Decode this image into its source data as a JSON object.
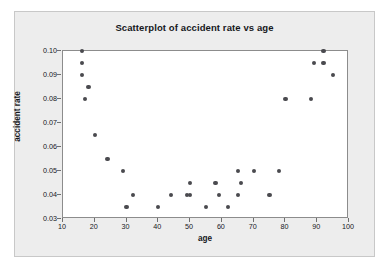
{
  "chart_data": {
    "type": "scatter",
    "title": "Scatterplot of accident rate vs age",
    "xlabel": "age",
    "ylabel": "accident rate",
    "xlim": [
      10,
      100
    ],
    "ylim": [
      0.03,
      0.1
    ],
    "grid": false,
    "legend": null,
    "marker_color": "#4a4a4f",
    "xticks": [
      10,
      20,
      30,
      40,
      50,
      60,
      70,
      80,
      90,
      100
    ],
    "xtick_labels": [
      "10",
      "20",
      "30",
      "40",
      "50",
      "60",
      "70",
      "80",
      "90",
      "100"
    ],
    "yticks": [
      0.03,
      0.04,
      0.05,
      0.06,
      0.07,
      0.08,
      0.09,
      0.1
    ],
    "ytick_labels": [
      "0.03",
      "0.04",
      "0.05",
      "0.06",
      "0.07",
      "0.08",
      "0.09",
      "0.10"
    ],
    "series": [
      {
        "name": "accident rate",
        "points": [
          {
            "x": 16,
            "y": 0.1
          },
          {
            "x": 16,
            "y": 0.095
          },
          {
            "x": 16,
            "y": 0.09
          },
          {
            "x": 18,
            "y": 0.085
          },
          {
            "x": 17,
            "y": 0.08
          },
          {
            "x": 20,
            "y": 0.065
          },
          {
            "x": 24,
            "y": 0.055
          },
          {
            "x": 29,
            "y": 0.05
          },
          {
            "x": 32,
            "y": 0.04
          },
          {
            "x": 30,
            "y": 0.035
          },
          {
            "x": 40,
            "y": 0.035
          },
          {
            "x": 44,
            "y": 0.04
          },
          {
            "x": 49,
            "y": 0.04
          },
          {
            "x": 50,
            "y": 0.04
          },
          {
            "x": 50,
            "y": 0.045
          },
          {
            "x": 55,
            "y": 0.035
          },
          {
            "x": 58,
            "y": 0.045
          },
          {
            "x": 59,
            "y": 0.04
          },
          {
            "x": 62,
            "y": 0.035
          },
          {
            "x": 65,
            "y": 0.05
          },
          {
            "x": 65,
            "y": 0.04
          },
          {
            "x": 66,
            "y": 0.045
          },
          {
            "x": 70,
            "y": 0.05
          },
          {
            "x": 75,
            "y": 0.04
          },
          {
            "x": 78,
            "y": 0.05
          },
          {
            "x": 80,
            "y": 0.08
          },
          {
            "x": 88,
            "y": 0.08
          },
          {
            "x": 89,
            "y": 0.095
          },
          {
            "x": 92,
            "y": 0.1
          },
          {
            "x": 92,
            "y": 0.095
          },
          {
            "x": 95,
            "y": 0.09
          }
        ]
      }
    ]
  }
}
